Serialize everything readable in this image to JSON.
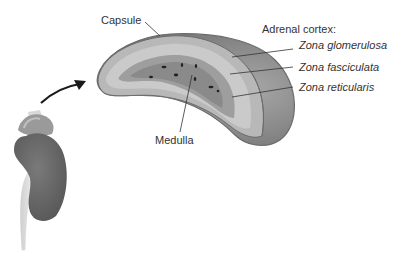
{
  "diagram": {
    "labels": {
      "capsule": "Capsule",
      "medulla": "Medulla",
      "cortex_heading": "Adrenal cortex:",
      "zones": [
        {
          "name": "Zona glomerulosa"
        },
        {
          "name": "Zona fasciculata"
        },
        {
          "name": "Zona reticularis"
        }
      ]
    },
    "colors": {
      "capsule_outline": "#6b6b6b",
      "glomerulosa": "#b8b8b8",
      "fasciculata": "#c9c9c9",
      "reticularis": "#9a9a9a",
      "medulla": "#8a8a8a",
      "outer_surface": "#8c8c8c",
      "kidney": "#6e6e6e",
      "arrow": "#1a1a1a"
    }
  }
}
